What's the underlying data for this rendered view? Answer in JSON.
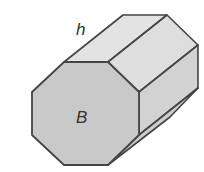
{
  "diagram": {
    "labels": {
      "height": "h",
      "base": "B"
    },
    "colors": {
      "front_face": "#c8c8c8",
      "top_face_1": "#e2e2e2",
      "top_face_2": "#dcdcdc",
      "side_face": "#cfcfcf",
      "stroke": "#444444",
      "background": "#ffffff"
    }
  }
}
